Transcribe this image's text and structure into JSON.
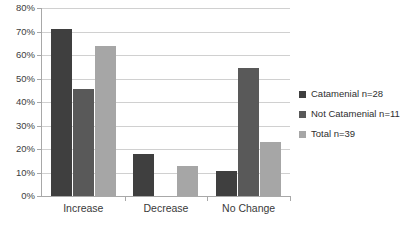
{
  "chart_data": {
    "type": "bar",
    "title": "",
    "subtitle": "",
    "xlabel": "",
    "ylabel": "",
    "categories": [
      "Increase",
      "Decrease",
      "No Change"
    ],
    "series": [
      {
        "name": "Catamenial n=28",
        "color": "#3f3f3f",
        "values": [
          71.0,
          17.9,
          10.7
        ]
      },
      {
        "name": "Not Catamenial n=11",
        "color": "#595959",
        "values": [
          45.5,
          0.0,
          54.5
        ]
      },
      {
        "name": "Total n=39",
        "color": "#a6a6a6",
        "values": [
          64.0,
          12.8,
          23.0
        ]
      }
    ],
    "ylim": [
      0,
      80
    ],
    "ytick_values": [
      0,
      10,
      20,
      30,
      40,
      50,
      60,
      70,
      80
    ],
    "ytick_labels": [
      "0%",
      "10%",
      "20%",
      "30%",
      "40%",
      "50%",
      "60%",
      "70%",
      "80%"
    ],
    "grid": true,
    "grid_axis": "y",
    "legend_position": "right",
    "value_unit": "%",
    "colors": {
      "gridline": "#d0d0d0",
      "axis": "#a8a8a8",
      "background": "#ffffff",
      "text": "#3a3a3a"
    }
  },
  "legend": {
    "entries": [
      {
        "label": "Catamenial n=28"
      },
      {
        "label": "Not Catamenial n=11"
      },
      {
        "label": "Total n=39"
      }
    ]
  }
}
